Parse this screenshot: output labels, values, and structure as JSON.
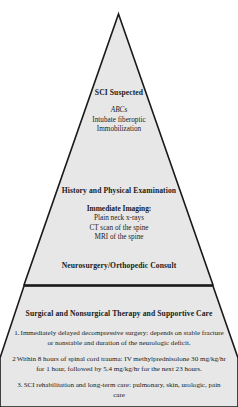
{
  "diagram": {
    "type": "pyramid-flowchart",
    "shape_name": "triangle-pyramid",
    "fill_color": "#e7e7e7",
    "stroke_color": "#1a1a1a",
    "background_color": "#ffffff",
    "tiers": [
      {
        "id": "sci-suspected",
        "heading": "SCI Suspected",
        "lines": [
          {
            "text": "ABCs",
            "style": "italic"
          },
          {
            "text": "Intubate fiberoptic",
            "style": "normal"
          },
          {
            "text": "Immobilization",
            "style": "normal"
          }
        ]
      },
      {
        "id": "history-physical",
        "heading": "History and Physical Examination",
        "subheading": "Immediate Imaging:",
        "lines": [
          {
            "text": "Plain neck x-rays",
            "style": "normal"
          },
          {
            "text": "CT scan of the spine",
            "style": "normal"
          },
          {
            "text": "MRI of the spine",
            "style": "normal"
          }
        ],
        "consult": "Neurosurgery/Orthopedic Consult"
      },
      {
        "id": "therapy-supportive-care",
        "heading": "Surgical and Nonsurgical Therapy and Supportive Care",
        "items": [
          {
            "number": "1.",
            "text": "Immediately delayed decompressive surgery: depends on stable fracture or nonstable and duration of the neurologic deficit."
          },
          {
            "number": "2",
            "text": "Within 8 hours of spinal cord trauma: IV methylprednisolone 30 mg/kg/hr for 1 hour, followed by 5.4 mg/kg/hr for the next 23 hours."
          },
          {
            "number": "3.",
            "text": "SCI rehabilitation and long-term care: pulmonary, skin, urologic, pain care"
          }
        ]
      }
    ]
  }
}
